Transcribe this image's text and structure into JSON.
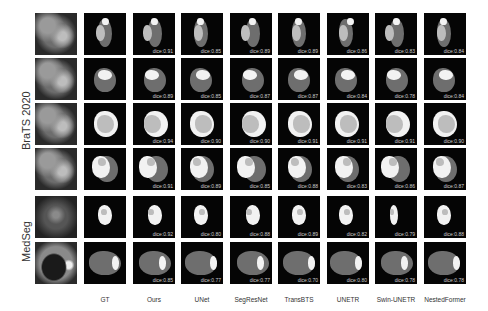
{
  "figure": {
    "groups": [
      {
        "label": "BraTS 2020",
        "rows": [
          0,
          1,
          2,
          3
        ]
      },
      {
        "label": "MedSeg",
        "rows": [
          4,
          5
        ]
      }
    ],
    "columns": [
      "GT",
      "Ours",
      "UNet",
      "SegResNet",
      "TransBTS",
      "UNETR",
      "Swin-UNETR",
      "NestedFormer"
    ],
    "rows": [
      {
        "dataset": "BraTS 2020",
        "dice": [
          "",
          "dice:0.91",
          "dice:0.85",
          "dice:0.89",
          "dice:0.89",
          "dice:0.86",
          "dice:0.83",
          "dice:0.84"
        ]
      },
      {
        "dataset": "BraTS 2020",
        "dice": [
          "",
          "dice:0.89",
          "dice:0.85",
          "dice:0.87",
          "dice:0.87",
          "dice:0.84",
          "dice:0.78",
          "dice:0.84"
        ]
      },
      {
        "dataset": "BraTS 2020",
        "dice": [
          "",
          "dice:0.94",
          "dice:0.90",
          "dice:0.90",
          "dice:0.91",
          "dice:0.91",
          "dice:0.91",
          "dice:0.90"
        ]
      },
      {
        "dataset": "BraTS 2020",
        "dice": [
          "",
          "dice:0.91",
          "dice:0.89",
          "dice:0.85",
          "dice:0.88",
          "dice:0.83",
          "dice:0.86",
          "dice:0.87"
        ]
      },
      {
        "dataset": "MedSeg",
        "dice": [
          "",
          "dice:0.92",
          "dice:0.80",
          "dice:0.88",
          "dice:0.89",
          "dice:0.82",
          "dice:0.79",
          "dice:0.88"
        ]
      },
      {
        "dataset": "MedSeg",
        "dice": [
          "",
          "dice:0.85",
          "dice:0.77",
          "dice:0.77",
          "dice:0.70",
          "dice:0.80",
          "dice:0.78",
          "dice:0.78"
        ]
      }
    ],
    "colors": {
      "background_cell": "#050505",
      "edema": "#6e6e6e",
      "core": "#bdbdbd",
      "enhancing": "#f2f2f2"
    }
  }
}
